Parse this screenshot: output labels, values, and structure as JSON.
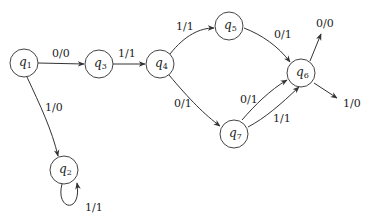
{
  "diagram": {
    "type": "mealy-state-machine",
    "states": [
      {
        "id": "q1",
        "label": "q",
        "sub": "1",
        "x": 24,
        "y": 63
      },
      {
        "id": "q2",
        "label": "q",
        "sub": "2",
        "x": 64,
        "y": 170
      },
      {
        "id": "q3",
        "label": "q",
        "sub": "3",
        "x": 99,
        "y": 64
      },
      {
        "id": "q4",
        "label": "q",
        "sub": "4",
        "x": 160,
        "y": 64
      },
      {
        "id": "q5",
        "label": "q",
        "sub": "5",
        "x": 229,
        "y": 26
      },
      {
        "id": "q6",
        "label": "q",
        "sub": "6",
        "x": 301,
        "y": 73
      },
      {
        "id": "q7",
        "label": "q",
        "sub": "7",
        "x": 234,
        "y": 132
      }
    ],
    "transitions": [
      {
        "from": "q1",
        "to": "q3",
        "label": "0/0"
      },
      {
        "from": "q1",
        "to": "q2",
        "label": "1/0"
      },
      {
        "from": "q2",
        "to": "q2",
        "label": "1/1"
      },
      {
        "from": "q3",
        "to": "q4",
        "label": "1/1"
      },
      {
        "from": "q4",
        "to": "q5",
        "label": "1/1"
      },
      {
        "from": "q4",
        "to": "q7",
        "label": "0/1"
      },
      {
        "from": "q5",
        "to": "q6",
        "label": "0/1"
      },
      {
        "from": "q7",
        "to": "q6",
        "label": "0/1"
      },
      {
        "from": "q7",
        "to": "q6",
        "label": "1/1"
      },
      {
        "from": "q6",
        "to": null,
        "label": "0/0"
      },
      {
        "from": "q6",
        "to": null,
        "label": "1/0"
      }
    ]
  }
}
